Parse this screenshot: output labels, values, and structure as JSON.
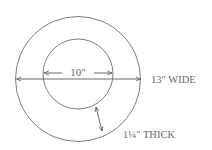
{
  "diagram": {
    "inner_label": "10″",
    "width_label": "13″ WIDE",
    "thickness_label": "1¼″ THICK",
    "inner_diameter": "10″",
    "outer_diameter": "13″",
    "thickness": "1¼″"
  },
  "colors": {
    "stroke": "#6f6f6f",
    "text": "#6a6a6a",
    "background": "#ffffff"
  }
}
